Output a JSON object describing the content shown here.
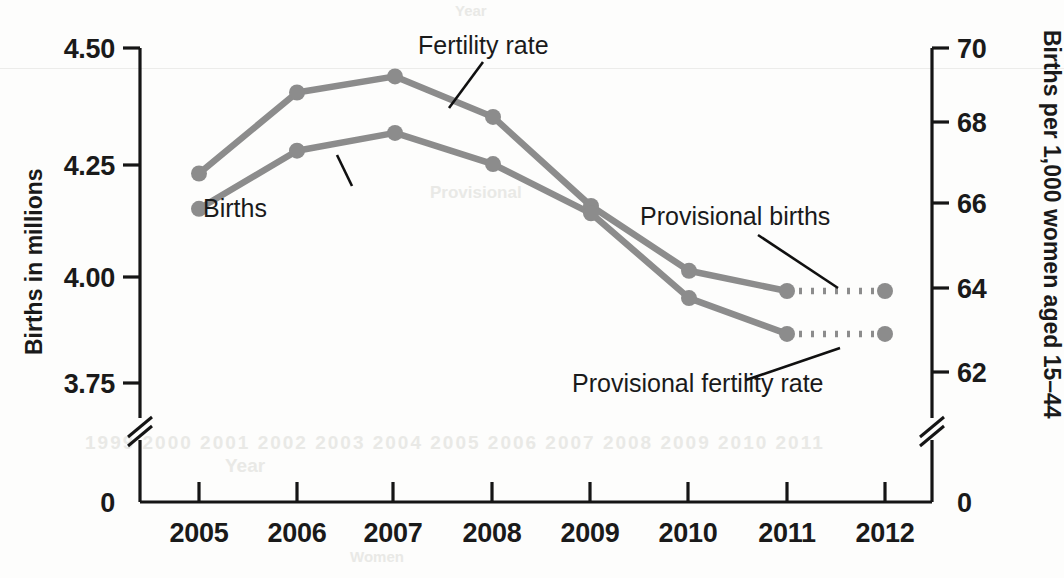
{
  "chart_data": {
    "type": "line",
    "title": "",
    "subtitle": "",
    "xlabel": "Year",
    "categories": [
      "2005",
      "2006",
      "2007",
      "2008",
      "2009",
      "2010",
      "2011",
      "2012"
    ],
    "x_tick_labels": [
      "2005",
      "2006",
      "2007",
      "2008",
      "2009",
      "2010",
      "2011",
      "2012"
    ],
    "grid": false,
    "legend_position": "inline-annotations",
    "axes": {
      "left": {
        "label": "Births in millions",
        "tick_labels": [
          "4.50",
          "4.25",
          "4.00",
          "3.75",
          "0"
        ],
        "tick_values": [
          4.5,
          4.25,
          4.0,
          3.75,
          0
        ],
        "ylim": [
          3.7,
          4.5
        ],
        "axis_break": true,
        "zero_label": "0"
      },
      "right": {
        "label": "Births per 1,000 women aged 15–44",
        "tick_labels": [
          "70",
          "68",
          "66",
          "64",
          "62",
          "0"
        ],
        "tick_values": [
          70,
          68,
          66,
          64,
          62,
          0
        ],
        "ylim": [
          61.3,
          70
        ],
        "axis_break": true,
        "zero_label": "0"
      }
    },
    "series": [
      {
        "name": "Fertility rate",
        "axis": "right",
        "unit": "births per 1,000 women aged 15-44",
        "color": "#8c8c8c",
        "x": [
          "2005",
          "2006",
          "2007",
          "2008",
          "2009",
          "2010",
          "2011",
          "2012"
        ],
        "values": [
          66.9,
          68.9,
          69.3,
          68.3,
          66.1,
          64.5,
          64.0,
          64.0
        ],
        "provisional_from": "2011",
        "provisional_segment_style": "dotted"
      },
      {
        "name": "Births",
        "axis": "left",
        "unit": "millions",
        "color": "#8c8c8c",
        "x": [
          "2005",
          "2006",
          "2007",
          "2008",
          "2009",
          "2010",
          "2011",
          "2012"
        ],
        "values": [
          4.14,
          4.27,
          4.31,
          4.24,
          4.13,
          3.94,
          3.86,
          3.86
        ],
        "provisional_from": "2011",
        "provisional_segment_style": "dotted"
      }
    ],
    "annotations": [
      {
        "name": "fertility-rate-label",
        "text": "Fertility rate"
      },
      {
        "name": "births-label",
        "text": "Births"
      },
      {
        "name": "provisional-births-label",
        "text": "Provisional births"
      },
      {
        "name": "provisional-fertility-rate-label",
        "text": "Provisional fertility rate"
      }
    ],
    "colors": {
      "series": "#8c8c8c",
      "axis": "#151515",
      "text": "#1a1a1a",
      "background": "#fdfdfc"
    }
  },
  "scan_artifacts": {
    "top": "Year",
    "mid_left": "Provisional",
    "bottom_years": "1999 2000 2001 2002 2003 2004 2005 2006 2007 2008 2009 2010 2011",
    "bottom_label": "Year",
    "bottom_small": "Women"
  }
}
